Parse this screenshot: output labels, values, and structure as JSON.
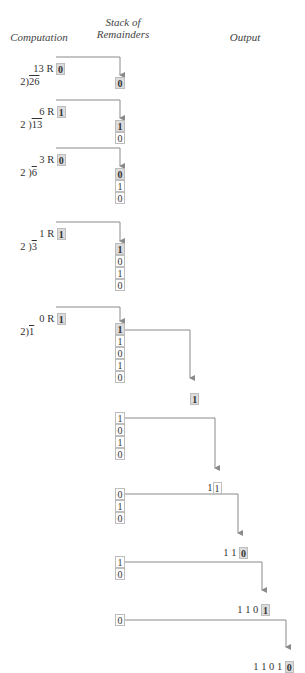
{
  "headers": {
    "computation": "Computation",
    "stack_line1": "Stack of",
    "stack_line2": "Remainders",
    "output": "Output"
  },
  "steps": [
    {
      "quotient": "13",
      "r_label": "R",
      "remainder": "0",
      "divisor": "2",
      "dividend": "26",
      "stack": [
        "0"
      ]
    },
    {
      "quotient": "6",
      "r_label": "R",
      "remainder": "1",
      "divisor": "2",
      "dividend": "13",
      "stack": [
        "1",
        "0"
      ]
    },
    {
      "quotient": "3",
      "r_label": "R",
      "remainder": "0",
      "divisor": "2",
      "dividend": "6",
      "stack": [
        "0",
        "1",
        "0"
      ]
    },
    {
      "quotient": "1",
      "r_label": "R",
      "remainder": "1",
      "divisor": "2",
      "dividend": "3",
      "stack": [
        "1",
        "0",
        "1",
        "0"
      ]
    },
    {
      "quotient": "0",
      "r_label": "R",
      "remainder": "1",
      "divisor": "2",
      "dividend": "1",
      "stack": [
        "1",
        "1",
        "0",
        "1",
        "0"
      ]
    }
  ],
  "pops": [
    {
      "stack": [
        "1",
        "1",
        "0",
        "1",
        "0"
      ],
      "output_prefix": "",
      "output_last": "1"
    },
    {
      "stack": [
        "1",
        "0",
        "1",
        "0"
      ],
      "output_prefix": "1",
      "output_last": "1"
    },
    {
      "stack": [
        "0",
        "1",
        "0"
      ],
      "output_prefix": "1 1",
      "output_last": "0"
    },
    {
      "stack": [
        "1",
        "0"
      ],
      "output_prefix": "1 1 0",
      "output_last": "1"
    },
    {
      "stack": [
        "0"
      ],
      "output_prefix": "1 1 0 1",
      "output_last": "0"
    }
  ],
  "colors": {
    "line": "#8a8a8a",
    "highlight": "#dcdcdc",
    "border": "#bdbdbd"
  }
}
